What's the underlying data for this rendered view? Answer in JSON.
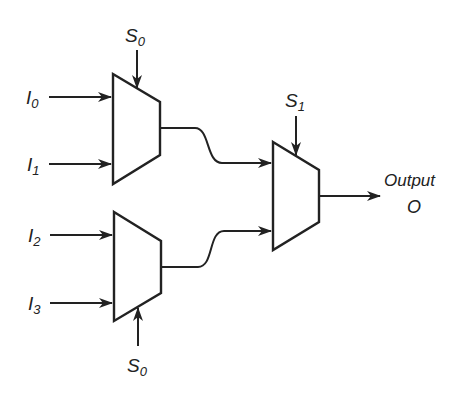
{
  "diagram": {
    "inputs": [
      {
        "id": "I0",
        "label": "I",
        "sub": "0"
      },
      {
        "id": "I1",
        "label": "I",
        "sub": "1"
      },
      {
        "id": "I2",
        "label": "I",
        "sub": "2"
      },
      {
        "id": "I3",
        "label": "I",
        "sub": "3"
      }
    ],
    "selects": [
      {
        "id": "S0-top",
        "label": "S",
        "sub": "0"
      },
      {
        "id": "S0-bottom",
        "label": "S",
        "sub": "0"
      },
      {
        "id": "S1",
        "label": "S",
        "sub": "1"
      }
    ],
    "output": {
      "label": "Output",
      "symbol": "O"
    },
    "blocks": [
      "mux-top",
      "mux-bottom",
      "mux-final"
    ],
    "colors": {
      "stroke": "#222222",
      "background": "#ffffff"
    }
  }
}
